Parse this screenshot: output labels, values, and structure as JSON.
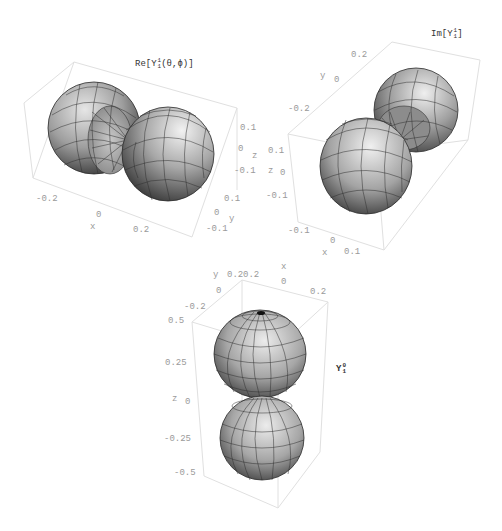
{
  "figure": {
    "colors": {
      "box_line": "#dedede",
      "tick_text": "#9a9a9a",
      "title_text": "#333333",
      "surface_light": "#cfcfcf",
      "surface_mid": "#9a9a9a",
      "surface_dark": "#3a3a3a",
      "mesh": "#2a2a2a"
    }
  },
  "plots": [
    {
      "id": "re-y11",
      "title": {
        "prefix": "Re[Y",
        "sup": "1",
        "sub": "1",
        "suffix": "(θ,ϕ)]"
      },
      "x_axis": {
        "label": "x",
        "ticks": [
          "-0.2",
          "0",
          "0.2"
        ]
      },
      "y_axis": {
        "label": "y",
        "ticks": [
          "0.1",
          "0",
          "-0.1"
        ]
      },
      "z_axis": {
        "label": "z",
        "ticks": [
          "0.1",
          "0",
          "-0.1"
        ]
      }
    },
    {
      "id": "im-y11",
      "title": {
        "prefix": "Im[Y",
        "sup": "1",
        "sub": "1",
        "suffix": "]"
      },
      "x_axis": {
        "label": "x",
        "ticks": [
          "-0.1",
          "0",
          "0.1"
        ]
      },
      "y_axis": {
        "label": "y",
        "ticks": [
          "0.2",
          "0",
          "-0.2"
        ]
      },
      "z_axis": {
        "label": "z",
        "ticks": [
          "0.1",
          "0",
          "-0.1"
        ]
      }
    },
    {
      "id": "y10",
      "title": {
        "prefix": "Y",
        "sup": "0",
        "sub": "1",
        "suffix": ""
      },
      "x_axis": {
        "label": "x",
        "ticks": [
          "0.2",
          "0",
          "0.2"
        ]
      },
      "y_axis": {
        "label": "y",
        "ticks": [
          "0.2",
          "0",
          "-0.2"
        ]
      },
      "z_axis": {
        "label": "z",
        "ticks": [
          "0.5",
          "0.25",
          "0",
          "-0.25",
          "-0.5"
        ]
      }
    }
  ]
}
